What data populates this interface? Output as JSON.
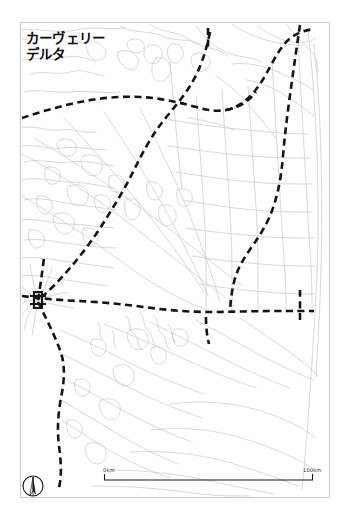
{
  "figure": {
    "kind": "reference-map",
    "width": 349,
    "height": 528,
    "background_color": "#ffffff",
    "frame": {
      "color": "#c9c9c9",
      "x": 20,
      "y": 22,
      "width": 310,
      "height": 476
    }
  },
  "title": {
    "text": "カーヴェリー\nデルタ",
    "line1": "カーヴェリー",
    "line2": "デルタ",
    "romanized": "Kavueri Deruta",
    "color": "#0a0a0a"
  },
  "legend_styles": {
    "major_route_color": "#141414",
    "major_route_description": "bold black dashed line",
    "minor_network_color": "#c4c4c4",
    "minor_network_description": "thin light gray line",
    "coastline_color": "#bdbdbd"
  },
  "scale_bar": {
    "start_label": "0km",
    "end_label": "100km",
    "distance_km": 100,
    "bar_x_start": 104,
    "bar_x_end": 313,
    "bar_y": 480,
    "color": "#1a1a1a"
  },
  "compass": {
    "name": "north-arrow",
    "center_x": 33,
    "center_y": 486,
    "radius": 10,
    "color": "#111111"
  },
  "map_features": {
    "major_routes": [
      {
        "name": "east-west-trunk-arc",
        "points": "22,118 48,110 76,103 104,98 132,97 160,100 186,104 208,110 226,110 244,104 258,94 268,80 276,62 284,46 292,36 302,32 314,30"
      },
      {
        "name": "north-south-east-corridor",
        "points": "300,26 296,44 292,66 288,88 284,110 282,134 280,158 276,182 268,204 256,222 244,238 236,256 232,276 230,296 230,312"
      },
      {
        "name": "central-diagonal-route",
        "points": "210,34 206,52 200,68 192,82 182,94 170,104 158,116 148,130 140,146 132,164 124,180 114,196 104,212 94,228 84,244 72,262 58,280 46,292 38,300"
      },
      {
        "name": "east-west-lower-trunk",
        "points": "22,296 34,298 52,300 74,301 96,302 118,303 140,306 162,309 184,311 206,312 228,312 250,311 272,311 294,311 312,311"
      },
      {
        "name": "south-west-branch",
        "points": "38,302 44,316 52,330 58,346 62,362 62,378 60,394 58,410 58,426 60,442 62,458 62,472 60,484 56,492"
      },
      {
        "name": "hub-north-spur",
        "points": "38,300 40,288 42,276 44,264 44,252"
      },
      {
        "name": "short-vertical-spur-top",
        "points": "208,30 208,46"
      },
      {
        "name": "mid-vertical-spur",
        "points": "206,318 206,330 208,342"
      },
      {
        "name": "coastal-spur-east",
        "points": "300,292 300,302 300,312 300,322"
      }
    ],
    "junctions": [
      {
        "name": "main-junction-hub",
        "x": 38,
        "y": 300
      },
      {
        "name": "east-junction",
        "x": 230,
        "y": 312
      },
      {
        "name": "coastal-junction",
        "x": 300,
        "y": 311
      }
    ]
  }
}
